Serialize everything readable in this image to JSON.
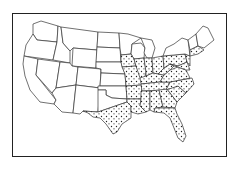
{
  "map": {
    "title": "United States map with stippled eastern states",
    "region": "Contiguous United States",
    "stippled_region": "Eastern United States (Midwest, South, East Coast)",
    "stipple_color": "#222222",
    "outline_color": "#333333",
    "background_color": "#ffffff",
    "legend": null
  }
}
